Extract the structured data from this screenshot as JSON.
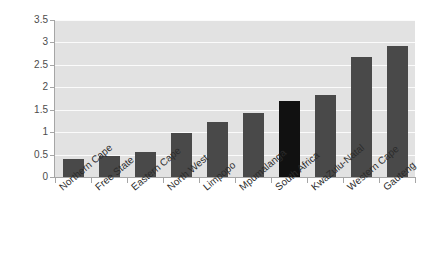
{
  "chart_data": {
    "type": "bar",
    "title": "",
    "subtitle": "",
    "xlabel": "",
    "ylabel": "",
    "ylim": [
      0,
      3.5
    ],
    "ytick_labels": [
      "3.5",
      "3",
      "2.5",
      "2",
      "1.5",
      "1",
      "0.5",
      "0"
    ],
    "ytick_values": [
      3.5,
      3,
      2.5,
      2,
      1.5,
      1,
      0.5,
      0
    ],
    "grid": true,
    "legend": false,
    "categories": [
      "Northern Cape",
      "Free State",
      "Eastern Cape",
      "North West",
      "Limpopo",
      "Mpumalanga",
      "South Africa",
      "KwaZulu-Natal",
      "Western Cape",
      "Gauteng"
    ],
    "values": [
      0.41,
      0.46,
      0.55,
      0.99,
      1.22,
      1.42,
      1.7,
      1.82,
      2.68,
      2.92
    ],
    "highlight_category": "South Africa",
    "bar_color": "#494949",
    "highlight_bar_color": "#111111",
    "plot_background": "#e2e2e2",
    "gridline_color": "#fbfbfb",
    "axis_color": "#a6a6a6",
    "label_color": "#2b2b2b"
  }
}
